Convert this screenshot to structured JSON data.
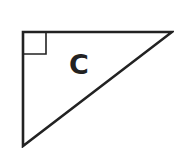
{
  "diagram": {
    "shape": "right-triangle",
    "label": "C",
    "stroke_color": "#222222",
    "fill_color": "#ffffff",
    "vertices": {
      "right_angle": [
        23,
        32
      ],
      "top_right": [
        172,
        32
      ],
      "bottom_left": [
        23,
        146
      ]
    },
    "right_angle_marker": true
  }
}
